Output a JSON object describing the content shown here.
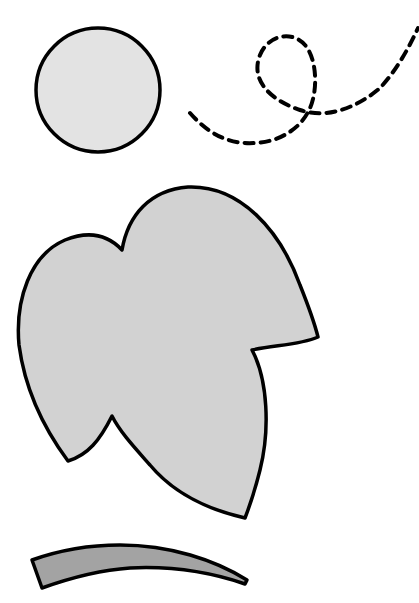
{
  "canvas": {
    "width": 419,
    "height": 603,
    "background": "#ffffff"
  },
  "colors": {
    "outline": "#000000",
    "circle_fill": "#e3e3e3",
    "leaf_fill": "#d2d2d2",
    "stem_fill": "#a3a3a3"
  },
  "shapes": [
    {
      "name": "circle",
      "type": "circle",
      "description": "light gray filled circle with black outline"
    },
    {
      "name": "dashed-loop-path",
      "type": "path",
      "description": "black dashed curving line with a loop"
    },
    {
      "name": "leaf",
      "type": "path",
      "description": "large light gray leaf shape with black outline"
    },
    {
      "name": "stem",
      "type": "path",
      "description": "curved darker gray stem shape with black outline"
    }
  ]
}
